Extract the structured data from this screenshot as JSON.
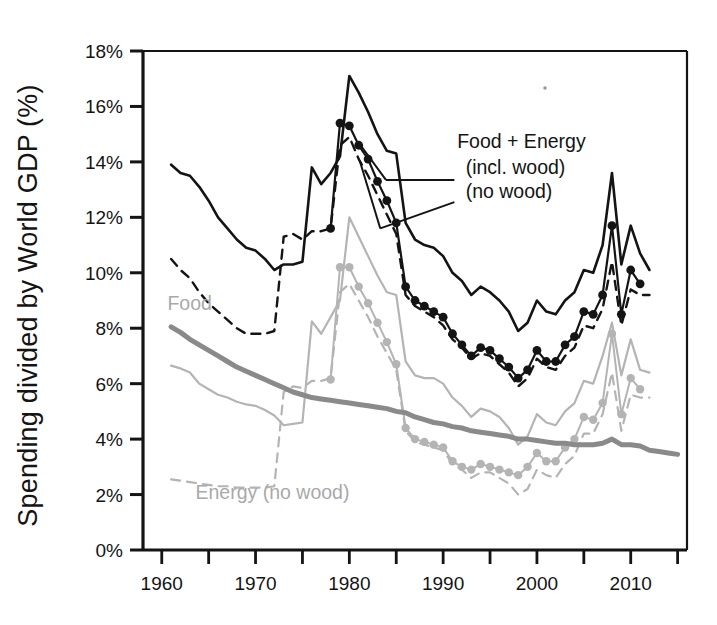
{
  "chart_data": {
    "type": "line",
    "title": "",
    "xlabel": "",
    "ylabel": "Spending divided by World GDP (%)",
    "xlim": [
      1958,
      2016
    ],
    "ylim": [
      0,
      18
    ],
    "ytick_labels": [
      "0%",
      "2%",
      "4%",
      "6%",
      "8%",
      "10%",
      "12%",
      "14%",
      "16%",
      "18%"
    ],
    "ytick_values": [
      0,
      2,
      4,
      6,
      8,
      10,
      12,
      14,
      16,
      18
    ],
    "xtick_labels": [
      "1960",
      "1970",
      "1980",
      "1990",
      "2000",
      "2010"
    ],
    "xtick_values": [
      1960,
      1970,
      1980,
      1990,
      2000,
      2010
    ],
    "xminor_ticks": [
      1960,
      1965,
      1970,
      1975,
      1980,
      1985,
      1990,
      1995,
      2000,
      2005,
      2010,
      2015
    ],
    "grid": false,
    "legend_position": "inline-annotations",
    "annotations": [
      {
        "name": "food-plus-energy",
        "text": "Food + Energy",
        "x": 1991.5,
        "y": 14.5,
        "color": "#141414"
      },
      {
        "name": "incl-wood",
        "text": "(incl. wood)",
        "x": 1992.4,
        "y": 13.55,
        "color": "#141414"
      },
      {
        "name": "no-wood",
        "text": "(no wood)",
        "x": 1992.4,
        "y": 12.7,
        "color": "#141414"
      },
      {
        "name": "food",
        "text": "Food",
        "x": 1960.6,
        "y": 8.65,
        "color": "#a9a9a9"
      },
      {
        "name": "energy-no-wood",
        "text": "Energy (no wood)",
        "x": 1963.6,
        "y": 1.85,
        "color": "#a9a9a9"
      }
    ],
    "series": [
      {
        "name": "Food + Energy (incl. wood)",
        "style": "solid",
        "color": "#141414",
        "width": 2.6,
        "markers": false,
        "x": [
          1961,
          1962,
          1963,
          1964,
          1965,
          1966,
          1967,
          1968,
          1969,
          1970,
          1971,
          1972,
          1973,
          1974,
          1975,
          1976,
          1977,
          1978,
          1979,
          1980,
          1981,
          1982,
          1983,
          1984,
          1985,
          1986,
          1987,
          1988,
          1989,
          1990,
          1991,
          1992,
          1993,
          1994,
          1995,
          1996,
          1997,
          1998,
          1999,
          2000,
          2001,
          2002,
          2003,
          2004,
          2005,
          2006,
          2007,
          2008,
          2009,
          2010,
          2011,
          2012
        ],
        "values": [
          13.9,
          13.6,
          13.5,
          13.1,
          12.6,
          12.0,
          11.6,
          11.2,
          10.9,
          10.8,
          10.5,
          10.1,
          10.3,
          10.3,
          10.4,
          13.8,
          13.2,
          13.6,
          14.2,
          17.1,
          16.5,
          15.8,
          15.0,
          14.4,
          14.3,
          11.8,
          11.2,
          11.0,
          10.9,
          10.6,
          10.0,
          9.7,
          9.2,
          9.5,
          9.3,
          9.0,
          8.6,
          7.9,
          8.2,
          9.0,
          8.6,
          8.5,
          9.0,
          9.3,
          10.1,
          10.0,
          11.0,
          13.6,
          10.3,
          11.7,
          10.7,
          10.1
        ]
      },
      {
        "name": "Food + Energy (no wood)",
        "style": "solid-markers",
        "color": "#141414",
        "width": 2.2,
        "markers": true,
        "x": [
          1978,
          1979,
          1980,
          1981,
          1982,
          1983,
          1984,
          1985,
          1986,
          1987,
          1988,
          1989,
          1990,
          1991,
          1992,
          1993,
          1994,
          1995,
          1996,
          1997,
          1998,
          1999,
          2000,
          2001,
          2002,
          2003,
          2004,
          2005,
          2006,
          2007,
          2008,
          2009,
          2010,
          2011
        ],
        "values": [
          11.6,
          15.4,
          15.3,
          14.6,
          14.1,
          13.3,
          12.6,
          11.8,
          9.5,
          9.0,
          8.8,
          8.6,
          8.4,
          7.8,
          7.4,
          7.0,
          7.3,
          7.2,
          6.9,
          6.6,
          6.2,
          6.5,
          7.2,
          6.8,
          6.8,
          7.4,
          7.7,
          8.6,
          8.5,
          9.2,
          11.7,
          8.5,
          10.1,
          9.6
        ]
      },
      {
        "name": "Food + Energy (dashed)",
        "style": "dashed",
        "color": "#141414",
        "width": 2.4,
        "markers": false,
        "x": [
          1961,
          1962,
          1963,
          1964,
          1965,
          1966,
          1967,
          1968,
          1969,
          1970,
          1971,
          1972,
          1973,
          1974,
          1975,
          1976,
          1977,
          1978,
          1979,
          1980,
          1981,
          1982,
          1983,
          1984,
          1985,
          1986,
          1987,
          1988,
          1989,
          1990,
          1991,
          1992,
          1993,
          1994,
          1995,
          1996,
          1997,
          1998,
          1999,
          2000,
          2001,
          2002,
          2003,
          2004,
          2005,
          2006,
          2007,
          2008,
          2009,
          2010,
          2011,
          2012
        ],
        "values": [
          10.5,
          10.1,
          9.8,
          9.3,
          8.9,
          8.6,
          8.3,
          8.0,
          7.8,
          7.8,
          7.8,
          7.9,
          11.3,
          11.4,
          11.2,
          11.5,
          11.5,
          11.6,
          14.6,
          14.9,
          14.1,
          13.5,
          12.8,
          12.1,
          11.4,
          9.2,
          8.8,
          8.6,
          8.4,
          8.1,
          7.6,
          7.3,
          6.9,
          7.1,
          7.0,
          6.7,
          6.4,
          5.9,
          6.2,
          6.9,
          6.6,
          6.5,
          7.0,
          7.3,
          8.1,
          8.0,
          8.7,
          10.4,
          8.1,
          9.4,
          9.2,
          9.2
        ]
      },
      {
        "name": "Food",
        "style": "solid-thick",
        "color": "#8a8a8a",
        "width": 5.0,
        "markers": false,
        "x": [
          1961,
          1962,
          1963,
          1964,
          1965,
          1966,
          1967,
          1968,
          1969,
          1970,
          1971,
          1972,
          1973,
          1974,
          1975,
          1976,
          1977,
          1978,
          1979,
          1980,
          1981,
          1982,
          1983,
          1984,
          1985,
          1986,
          1987,
          1988,
          1989,
          1990,
          1991,
          1992,
          1993,
          1994,
          1995,
          1996,
          1997,
          1998,
          1999,
          2000,
          2001,
          2002,
          2003,
          2004,
          2005,
          2006,
          2007,
          2008,
          2009,
          2010,
          2011,
          2012,
          2013,
          2014,
          2015
        ],
        "values": [
          8.05,
          7.85,
          7.6,
          7.4,
          7.2,
          7.0,
          6.8,
          6.6,
          6.45,
          6.3,
          6.15,
          6.0,
          5.85,
          5.7,
          5.6,
          5.5,
          5.45,
          5.4,
          5.35,
          5.3,
          5.25,
          5.2,
          5.15,
          5.1,
          5.0,
          4.95,
          4.8,
          4.7,
          4.6,
          4.55,
          4.45,
          4.4,
          4.3,
          4.25,
          4.2,
          4.15,
          4.1,
          4.0,
          4.0,
          3.95,
          3.9,
          3.85,
          3.85,
          3.8,
          3.8,
          3.8,
          3.85,
          4.0,
          3.8,
          3.8,
          3.75,
          3.6,
          3.55,
          3.5,
          3.45
        ]
      },
      {
        "name": "Energy (incl. wood)",
        "style": "solid-thin",
        "color": "#b4b4b4",
        "width": 2.2,
        "markers": false,
        "x": [
          1961,
          1962,
          1963,
          1964,
          1965,
          1966,
          1967,
          1968,
          1969,
          1970,
          1971,
          1972,
          1973,
          1974,
          1975,
          1976,
          1977,
          1978,
          1979,
          1980,
          1981,
          1982,
          1983,
          1984,
          1985,
          1986,
          1987,
          1988,
          1989,
          1990,
          1991,
          1992,
          1993,
          1994,
          1995,
          1996,
          1997,
          1998,
          1999,
          2000,
          2001,
          2002,
          2003,
          2004,
          2005,
          2006,
          2007,
          2008,
          2009,
          2010,
          2011,
          2012
        ],
        "values": [
          6.65,
          6.55,
          6.4,
          6.0,
          5.8,
          5.6,
          5.5,
          5.35,
          5.25,
          5.2,
          5.05,
          4.85,
          4.5,
          4.55,
          4.6,
          8.25,
          7.8,
          8.4,
          9.0,
          12.0,
          11.3,
          10.6,
          9.9,
          9.3,
          9.2,
          6.8,
          6.3,
          6.2,
          6.2,
          6.0,
          5.5,
          5.2,
          4.8,
          5.1,
          5.0,
          4.8,
          4.4,
          3.8,
          4.1,
          4.9,
          4.6,
          4.5,
          5.0,
          5.3,
          6.1,
          6.0,
          7.0,
          8.2,
          6.3,
          7.6,
          6.5,
          6.4
        ]
      },
      {
        "name": "Energy (no wood) markers",
        "style": "solid-thin-markers",
        "color": "#b4b4b4",
        "width": 2.0,
        "markers": true,
        "x": [
          1978,
          1979,
          1980,
          1981,
          1982,
          1983,
          1984,
          1985,
          1986,
          1987,
          1988,
          1989,
          1990,
          1991,
          1992,
          1993,
          1994,
          1995,
          1996,
          1997,
          1998,
          1999,
          2000,
          2001,
          2002,
          2003,
          2004,
          2005,
          2006,
          2007,
          2008,
          2009,
          2010,
          2011
        ],
        "values": [
          6.15,
          10.2,
          10.2,
          9.5,
          8.9,
          8.2,
          7.5,
          6.7,
          4.4,
          4.0,
          3.9,
          3.8,
          3.7,
          3.2,
          3.0,
          2.9,
          3.1,
          3.0,
          2.9,
          2.8,
          2.7,
          3.0,
          3.5,
          3.2,
          3.2,
          3.7,
          4.0,
          4.8,
          4.7,
          5.3,
          7.8,
          4.9,
          6.2,
          5.8
        ]
      },
      {
        "name": "Energy (no wood) dashed",
        "style": "dashed-thin",
        "color": "#b4b4b4",
        "width": 2.2,
        "markers": false,
        "x": [
          1961,
          1962,
          1963,
          1964,
          1965,
          1966,
          1967,
          1968,
          1969,
          1970,
          1971,
          1972,
          1973,
          1974,
          1975,
          1976,
          1977,
          1978,
          1979,
          1980,
          1981,
          1982,
          1983,
          1984,
          1985,
          1986,
          1987,
          1988,
          1989,
          1990,
          1991,
          1992,
          1993,
          1994,
          1995,
          1996,
          1997,
          1998,
          1999,
          2000,
          2001,
          2002,
          2003,
          2004,
          2005,
          2006,
          2007,
          2008,
          2009,
          2010,
          2011,
          2012
        ],
        "values": [
          2.55,
          2.5,
          2.45,
          2.4,
          2.35,
          2.3,
          2.3,
          2.25,
          2.25,
          2.25,
          2.25,
          2.3,
          5.7,
          5.9,
          5.85,
          6.1,
          6.1,
          6.2,
          9.3,
          9.6,
          9.0,
          8.4,
          7.7,
          7.1,
          6.5,
          4.3,
          3.9,
          3.8,
          3.7,
          3.6,
          3.1,
          2.9,
          2.6,
          2.8,
          2.8,
          2.6,
          2.4,
          2.0,
          2.2,
          2.9,
          2.7,
          2.6,
          3.1,
          3.4,
          4.2,
          4.2,
          4.9,
          6.4,
          4.3,
          5.6,
          5.5,
          5.5
        ]
      }
    ]
  }
}
